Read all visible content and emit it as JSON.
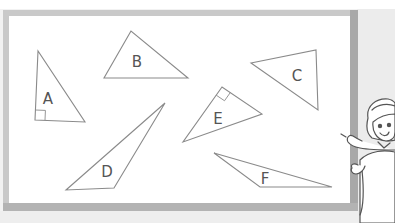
{
  "figure": {
    "board": {
      "frame_color": "#c8c8c8",
      "frame_shadow": "#a9a9a9",
      "surface_color": "#ffffff"
    },
    "stroke_color": "#8a8a8a",
    "triangles": [
      {
        "label": "A",
        "points": [
          [
            38,
            51
          ],
          [
            35,
            120
          ],
          [
            85,
            122
          ]
        ],
        "label_pos": [
          48,
          104
        ],
        "right_angle_marker": true
      },
      {
        "label": "B",
        "points": [
          [
            131,
            31
          ],
          [
            104,
            78
          ],
          [
            188,
            78
          ]
        ],
        "label_pos": [
          137,
          67
        ],
        "right_angle_marker": false
      },
      {
        "label": "C",
        "points": [
          [
            251,
            63
          ],
          [
            316,
            50
          ],
          [
            318,
            110
          ]
        ],
        "label_pos": [
          297,
          81
        ],
        "right_angle_marker": false
      },
      {
        "label": "D",
        "points": [
          [
            165,
            103
          ],
          [
            66,
            190
          ],
          [
            114,
            188
          ]
        ],
        "label_pos": [
          107,
          177
        ],
        "right_angle_marker": false
      },
      {
        "label": "E",
        "points": [
          [
            222,
            87
          ],
          [
            183,
            142
          ],
          [
            262,
            114
          ]
        ],
        "label_pos": [
          218,
          124
        ],
        "right_angle_marker": true
      },
      {
        "label": "F",
        "points": [
          [
            214,
            153
          ],
          [
            260,
            187
          ],
          [
            332,
            187
          ]
        ],
        "label_pos": [
          265,
          184
        ],
        "right_angle_marker": false
      }
    ],
    "character": {
      "name": "girl-pointing",
      "position": "right edge"
    }
  }
}
